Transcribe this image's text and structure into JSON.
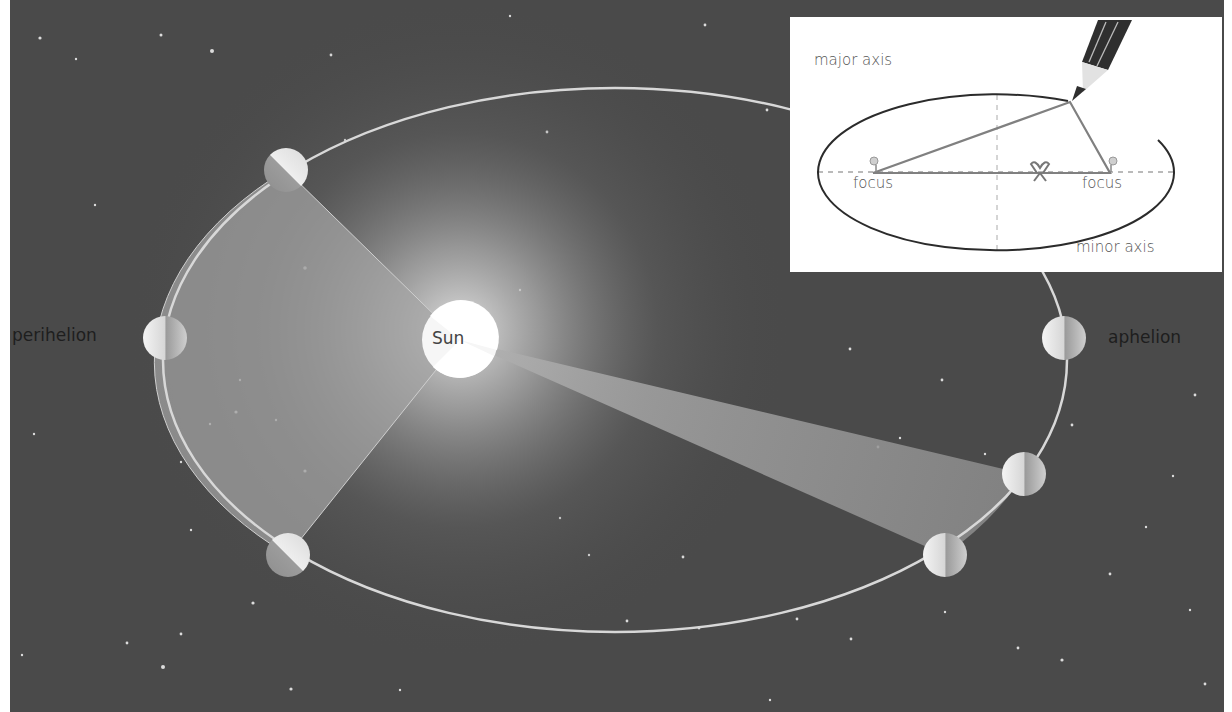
{
  "diagram": {
    "colors": {
      "space_background": "#4a4a4a",
      "orbit_line": "#d8d8d8",
      "swept_area": "#9a9a9a",
      "sun": "#ffffff",
      "inset_background": "#ffffff",
      "inset_ellipse": "#2b2b2b",
      "inset_string": "#777777",
      "label_text": "#1e1e1e"
    },
    "labels": {
      "sun": "Sun",
      "perihelion": "perihelion",
      "aphelion": "aphelion"
    },
    "orbit": {
      "center_x": 615,
      "center_y": 360,
      "rx": 452,
      "ry": 272
    },
    "sun": {
      "x": 460,
      "y": 340,
      "r": 38
    },
    "planets": [
      {
        "name": "planet-top-left",
        "x": 286,
        "y": 170
      },
      {
        "name": "planet-perihelion",
        "x": 165,
        "y": 338
      },
      {
        "name": "planet-bottom-left",
        "x": 288,
        "y": 555
      },
      {
        "name": "planet-aphelion",
        "x": 1064,
        "y": 338
      },
      {
        "name": "planet-lower-right-upper",
        "x": 1024,
        "y": 474
      },
      {
        "name": "planet-lower-right-lower",
        "x": 945,
        "y": 555
      }
    ],
    "inset": {
      "major_axis_label": "major axis",
      "minor_axis_label": "minor axis",
      "focus_left_label": "focus",
      "focus_right_label": "focus"
    }
  }
}
